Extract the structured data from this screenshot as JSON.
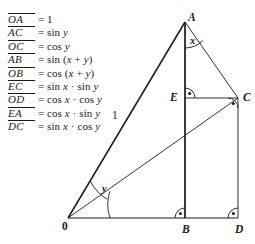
{
  "figure": {
    "background": "#ffffff",
    "stroke": "#1a1a1a"
  },
  "legend": {
    "rows": [
      {
        "segment": "OA",
        "equals": "=",
        "value": "1"
      },
      {
        "segment": "AC",
        "equals": "=",
        "value": "sin y"
      },
      {
        "segment": "OC",
        "equals": "=",
        "value": "cos y"
      },
      {
        "segment": "AB",
        "equals": "=",
        "value": "sin (x + y)"
      },
      {
        "segment": "OB",
        "equals": "=",
        "value": "cos (x + y)"
      },
      {
        "segment": "EC",
        "equals": "=",
        "value": "sin x · sin y"
      },
      {
        "segment": "OD",
        "equals": "=",
        "value": "cos x · cos y"
      },
      {
        "segment": "EA",
        "equals": "=",
        "value": "cos x · sin y"
      },
      {
        "segment": "DC",
        "equals": "=",
        "value": "sin x · cos y"
      }
    ]
  },
  "diagram": {
    "points": [
      {
        "name": "A",
        "label": "A",
        "x": 185,
        "y": 22
      },
      {
        "name": "C",
        "label": "C",
        "x": 238,
        "y": 98
      },
      {
        "name": "E",
        "label": "E",
        "x": 185,
        "y": 98
      },
      {
        "name": "O",
        "label": "0",
        "x": 68,
        "y": 218
      },
      {
        "name": "B",
        "label": "B",
        "x": 185,
        "y": 218
      },
      {
        "name": "D",
        "label": "D",
        "x": 238,
        "y": 218
      }
    ],
    "angles": [
      {
        "name": "x",
        "label": "x",
        "at": "A",
        "between": "AB and AC"
      },
      {
        "name": "y",
        "label": "y",
        "at": "O",
        "between": "OC and OA"
      }
    ],
    "lengths": [
      {
        "name": "OA",
        "label": "1"
      }
    ],
    "right_angles": [
      {
        "at": "E",
        "note": "angle AEC"
      },
      {
        "at": "C",
        "note": "angle ECD / OCA"
      },
      {
        "at": "B",
        "note": "angle ABD"
      },
      {
        "at": "D",
        "note": "angle CDB"
      }
    ]
  }
}
